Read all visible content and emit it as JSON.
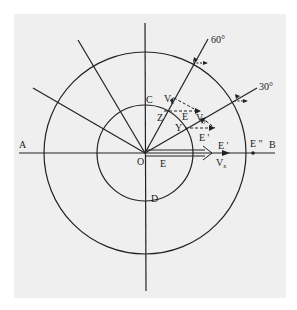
{
  "diagram": {
    "type": "concentric-circle vector diagram",
    "center": {
      "label": "O"
    },
    "axis_labels": {
      "left": "A",
      "right": "B",
      "top_inner": "C",
      "bottom_inner": "D"
    },
    "ray_labels": {
      "ray_60": "60°",
      "ray_30": "30°"
    },
    "points": {
      "z": "Z",
      "y": "Y"
    },
    "vectors": {
      "vz": "V",
      "vz_sub": "z",
      "vy": "V",
      "vy_sub": "y",
      "vx": "V",
      "vx_sub": "x",
      "e_main": "E",
      "e_inner": "E",
      "e_prime_1": "E '",
      "e_prime_2": "E '",
      "e_double_prime": "E \""
    },
    "colors": {
      "background_panel": "#efefef",
      "line": "#222222",
      "page": "#ffffff"
    }
  }
}
